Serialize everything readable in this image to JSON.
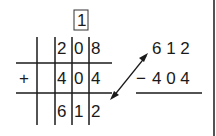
{
  "carry": "1",
  "addition": {
    "operator": "+",
    "addend1": [
      "2",
      "0",
      "8"
    ],
    "addend2": [
      "4",
      "0",
      "4"
    ],
    "sum": [
      "6",
      "1",
      "2"
    ]
  },
  "check": {
    "minuend": "6 1 2",
    "subtrahend_operator": "−",
    "subtrahend": "4 0 4"
  },
  "colors": {
    "ink": "#1a1a1a",
    "background": "#ffffff"
  }
}
